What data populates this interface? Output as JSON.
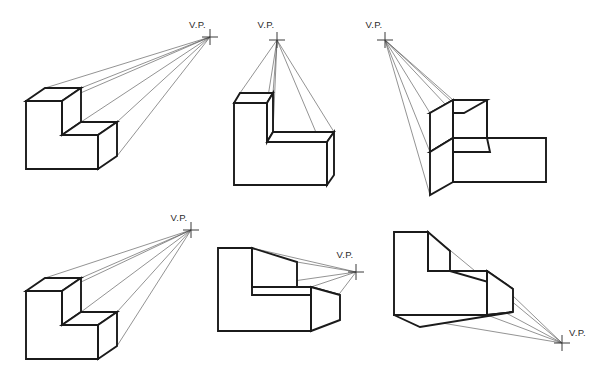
{
  "figure": {
    "background_color": "#ffffff",
    "line_color": "#1b1b1b",
    "projector_color": "#4a4a4a",
    "canvas": {
      "width": 601,
      "height": 376
    }
  },
  "vanishing_points": [
    {
      "id": "vp-1",
      "label": "V.P.",
      "label_x": 189,
      "label_y": 28,
      "x": 210,
      "y": 37,
      "position_note": "upper-right, far from block",
      "figure_index": 1
    },
    {
      "id": "vp-2",
      "label": "V.P.",
      "label_x": 266,
      "label_y": 28,
      "x": 277,
      "y": 40,
      "position_note": "directly above block",
      "figure_index": 2
    },
    {
      "id": "vp-3",
      "label": "V.P.",
      "label_x": 374,
      "label_y": 28,
      "x": 385,
      "y": 40,
      "position_note": "upper-left of block",
      "figure_index": 3
    },
    {
      "id": "vp-4",
      "label": "V.P.",
      "label_x": 179,
      "label_y": 221,
      "x": 191,
      "y": 230,
      "position_note": "upper-right, far from block",
      "figure_index": 4
    },
    {
      "id": "vp-5",
      "label": "V.P.",
      "label_x": 345,
      "label_y": 258,
      "x": 356,
      "y": 272,
      "position_note": "right of block, near eye level",
      "figure_index": 5
    },
    {
      "id": "vp-6",
      "label": "V.P.",
      "label_x": 569,
      "label_y": 336,
      "x": 562,
      "y": 343,
      "position_note": "lower-right, below block",
      "figure_index": 6
    }
  ],
  "blocks": [
    {
      "id": "block-1",
      "name": "l-block-vp-upper-right",
      "row": 1,
      "column": 1,
      "view": "front face with top and right receding faces visible",
      "front_face": "26,101 62,101 62,135 98,135 98,169 26,169",
      "top_high": "26,101 45,88 81,88 62,101",
      "top_high_right": "62,101 81,88 81,122 62,135",
      "step_top": "62,135 81,122 117,122 98,135",
      "right_low": "98,135 117,122 117,156 98,169",
      "detail_lines": [
        "62,101 62,135",
        "98,135 98,169",
        "62,135 98,135"
      ],
      "projector_targets": [
        "45,88",
        "81,88",
        "81,122",
        "117,122",
        "117,156"
      ]
    },
    {
      "id": "block-2",
      "name": "l-block-vp-above",
      "row": 1,
      "column": 2,
      "view": "front face with narrow top faces, vanishing point overhead",
      "front_face": "234,103 267,103 267,142 327,142 327,185 234,185",
      "top_high": "234,103 240,93 273,93 267,103",
      "top_high_right": "267,103 273,93 273,132 267,142",
      "step_top": "267,142 273,132 334,132 327,142",
      "right_low": "327,142 334,132 334,175 327,185",
      "detail_lines": [
        "267,103 267,142",
        "327,142 327,185",
        "267,142 327,142"
      ],
      "projector_targets": [
        "240,93",
        "273,93",
        "273,132",
        "334,132",
        "334,175"
      ]
    },
    {
      "id": "block-3",
      "name": "l-block-vp-upper-left",
      "row": 1,
      "column": 3,
      "view": "mirrored block, left face receding toward upper-left vanishing point",
      "front_face": "453,100 487,100 487,138 546,138 546,182 453,182",
      "top_high": "453,100 430,113 464,113 487,100",
      "left_high": "453,100 430,113 430,152 453,138",
      "step_top": "453,138 430,152 490,152 487,138",
      "left_low": "453,138 453,182 430,195 430,152",
      "detail_lines": [
        "487,100 487,138",
        "453,138 487,138",
        "453,138 453,182"
      ],
      "projector_targets": [
        "430,113",
        "464,113",
        "430,152",
        "430,195"
      ]
    },
    {
      "id": "block-4",
      "name": "l-block-vp-upper-right-lower-row",
      "row": 2,
      "column": 1,
      "view": "front face with top and right receding faces visible",
      "front_face": "26,291 62,291 62,325 98,325 98,359 26,359",
      "top_high": "26,291 45,278 81,278 62,291",
      "top_high_right": "62,291 81,278 81,312 62,325",
      "step_top": "62,325 81,312 117,312 98,325",
      "right_low": "98,325 117,312 117,346 98,359",
      "detail_lines": [
        "62,291 62,325",
        "98,325 98,359",
        "62,325 98,325"
      ],
      "projector_targets": [
        "45,278",
        "81,278",
        "81,312",
        "117,312",
        "117,346"
      ]
    },
    {
      "id": "block-5",
      "name": "l-block-vp-right-eye-level",
      "row": 2,
      "column": 2,
      "view": "vanishing point at eye level to the right; step top visible, upper top face hidden",
      "front_face": "218,248 252,248 252,287 311,287 311,331 218,331",
      "top_high": "252,248 297,262 297,287 252,287",
      "step_top": "252,287 311,287 340,295 252,295",
      "right_low": "311,287 340,295 340,320 311,331",
      "detail_lines": [
        "252,248 252,287",
        "252,287 311,287",
        "311,287 311,331"
      ],
      "projector_targets": [
        "297,262",
        "297,287",
        "340,295",
        "340,320"
      ]
    },
    {
      "id": "block-6",
      "name": "l-block-vp-lower-right",
      "row": 2,
      "column": 3,
      "view": "vanishing point below; underside and right faces recede downward",
      "front_face": "394,232 428,232 428,271 487,271 487,315 394,315",
      "top_high": "428,232 450,251 450,271 428,271",
      "step_top": "487,271 513,289 450,289 428,271",
      "right_low": "487,271 513,289 513,312 487,315",
      "bottom_face": "394,315 487,315 513,312 420,327",
      "detail_lines": [
        "428,232 428,271",
        "428,271 487,271",
        "487,271 487,315"
      ],
      "projector_targets": [
        "450,251",
        "450,271",
        "513,289",
        "513,312",
        "420,327"
      ]
    }
  ]
}
